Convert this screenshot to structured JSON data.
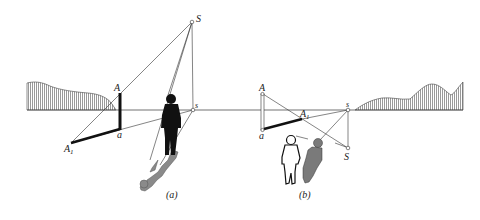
{
  "figure": {
    "colors": {
      "line": "#333333",
      "thick_line": "#111111",
      "figure_fill_dark": "#111111",
      "shadow_fill": "#8a8a8a",
      "terrain_hatch": "#555555"
    },
    "panel_a": {
      "caption": "(a)",
      "labels": {
        "light_source": "S",
        "light_foot": "s",
        "top_point": "A",
        "base_point": "a",
        "shadow_point": "A",
        "shadow_subscript": "1"
      }
    },
    "panel_b": {
      "caption": "(b)",
      "labels": {
        "light_source": "S",
        "light_foot": "s",
        "top_point": "A",
        "base_point": "a",
        "shadow_point": "A",
        "shadow_subscript": "1"
      }
    }
  }
}
